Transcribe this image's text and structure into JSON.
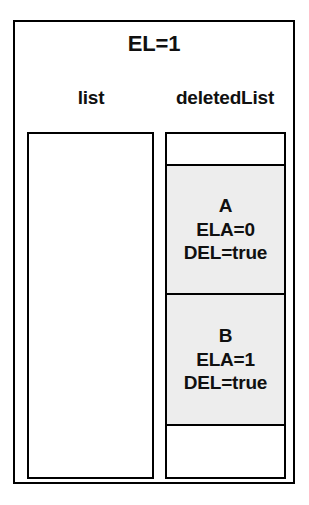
{
  "figure": {
    "clipped_caption_above": "",
    "outer_container": {
      "title": "EL=1",
      "columns": [
        {
          "label": "list"
        },
        {
          "label": "deletedList"
        }
      ]
    },
    "list_panel": {
      "name": "list",
      "items": []
    },
    "deleted_list_panel": {
      "name": "deletedList",
      "cells": [
        {
          "kind": "empty",
          "lines": []
        },
        {
          "kind": "node",
          "id": "A",
          "fill": "#ededed",
          "lines": [
            "A",
            "ELA=0",
            "DEL=true"
          ],
          "attributes": {
            "ELA": "0",
            "DEL": "true"
          }
        },
        {
          "kind": "node",
          "id": "B",
          "fill": "#ededed",
          "lines": [
            "B",
            "ELA=1",
            "DEL=true"
          ],
          "attributes": {
            "ELA": "1",
            "DEL": "true"
          }
        },
        {
          "kind": "empty",
          "lines": []
        }
      ]
    },
    "colors": {
      "stroke": "#000000",
      "background": "#ffffff",
      "node_fill": "#ededed",
      "text": "#101010"
    }
  }
}
